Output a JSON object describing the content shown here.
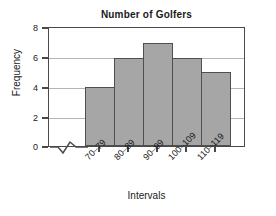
{
  "chart_data": {
    "type": "bar",
    "title": "Number of Golfers",
    "xlabel": "Intervals",
    "ylabel": "Frequency",
    "categories": [
      "70–79",
      "80–89",
      "90–99",
      "100–109",
      "110–119"
    ],
    "values": [
      4,
      6,
      7,
      6,
      5
    ],
    "ylim": [
      0,
      8
    ],
    "yticks": [
      0,
      2,
      4,
      6,
      8
    ],
    "ytick_labels": [
      "0",
      "2",
      "4",
      "6",
      "8"
    ],
    "grid": true,
    "grid_axis": "y",
    "legend": false,
    "annotations": [
      "x-axis break symbol between origin and first bar"
    ],
    "colors": {
      "bar_fill": "#a6a6a6",
      "bar_edge": "#4f4f4f",
      "frame": "#4a4a4a",
      "grid": "#b4b4b4",
      "text": "#1a1a1a",
      "background": "#ffffff"
    }
  },
  "chart": {
    "title": "Number of Golfers",
    "y_axis_title": "Frequency",
    "x_axis_title": "Intervals",
    "y_labels": [
      "0",
      "2",
      "4",
      "6",
      "8"
    ],
    "x_labels": [
      "70–79",
      "80–89",
      "90–99",
      "100–109",
      "110–119"
    ]
  }
}
